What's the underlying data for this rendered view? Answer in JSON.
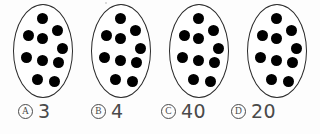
{
  "worksheet": {
    "type": "multiple-choice-counting-question",
    "group_count": 4,
    "dots_per_group": 10,
    "total_dots": 40,
    "groups": [
      {
        "id": "group-1",
        "dot_count": 10,
        "dots": [
          {
            "x": 24,
            "y": 9
          },
          {
            "x": 10,
            "y": 26
          },
          {
            "x": 24,
            "y": 29
          },
          {
            "x": 39,
            "y": 21
          },
          {
            "x": 44,
            "y": 39
          },
          {
            "x": 8,
            "y": 48
          },
          {
            "x": 24,
            "y": 51
          },
          {
            "x": 40,
            "y": 53
          },
          {
            "x": 19,
            "y": 70
          },
          {
            "x": 36,
            "y": 72
          }
        ]
      },
      {
        "id": "group-2",
        "dot_count": 10,
        "dots": [
          {
            "x": 24,
            "y": 9
          },
          {
            "x": 10,
            "y": 26
          },
          {
            "x": 24,
            "y": 29
          },
          {
            "x": 39,
            "y": 21
          },
          {
            "x": 44,
            "y": 39
          },
          {
            "x": 8,
            "y": 48
          },
          {
            "x": 24,
            "y": 51
          },
          {
            "x": 40,
            "y": 53
          },
          {
            "x": 19,
            "y": 70
          },
          {
            "x": 36,
            "y": 72
          }
        ]
      },
      {
        "id": "group-3",
        "dot_count": 10,
        "dots": [
          {
            "x": 24,
            "y": 9
          },
          {
            "x": 10,
            "y": 26
          },
          {
            "x": 24,
            "y": 29
          },
          {
            "x": 39,
            "y": 21
          },
          {
            "x": 44,
            "y": 39
          },
          {
            "x": 8,
            "y": 48
          },
          {
            "x": 24,
            "y": 51
          },
          {
            "x": 40,
            "y": 53
          },
          {
            "x": 19,
            "y": 70
          },
          {
            "x": 36,
            "y": 72
          }
        ]
      },
      {
        "id": "group-4",
        "dot_count": 10,
        "dots": [
          {
            "x": 24,
            "y": 9
          },
          {
            "x": 10,
            "y": 26
          },
          {
            "x": 24,
            "y": 29
          },
          {
            "x": 39,
            "y": 21
          },
          {
            "x": 44,
            "y": 39
          },
          {
            "x": 8,
            "y": 48
          },
          {
            "x": 24,
            "y": 51
          },
          {
            "x": 40,
            "y": 53
          },
          {
            "x": 19,
            "y": 70
          },
          {
            "x": 36,
            "y": 72
          }
        ]
      }
    ],
    "group_positions": [
      13,
      91,
      169,
      247
    ],
    "options": [
      {
        "letter": "A",
        "value": "3",
        "left": 18
      },
      {
        "letter": "B",
        "value": "4",
        "left": 91
      },
      {
        "letter": "C",
        "value": "40",
        "left": 161
      },
      {
        "letter": "D",
        "value": "20",
        "left": 231
      }
    ],
    "colors": {
      "dot": "#000000",
      "oval_stroke": "#2b2b2b",
      "text": "#4a4a4a",
      "background": "#fdfdfd"
    }
  }
}
